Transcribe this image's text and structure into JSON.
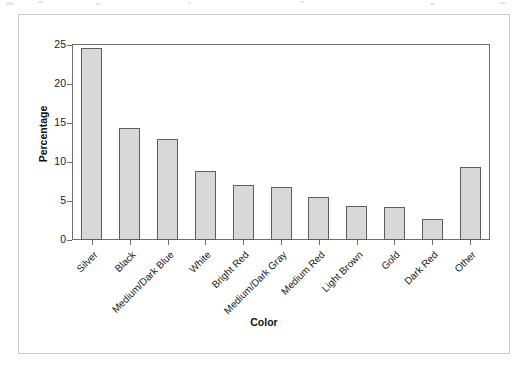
{
  "figure": {
    "background_color": "#ffffff",
    "frame_color": "#c9c9c9",
    "axis_color": "#6e6e6e"
  },
  "chart_data": {
    "type": "bar",
    "title": "",
    "subtitle": "",
    "xlabel": "Color",
    "ylabel": "Percentage",
    "categories": [
      "Silver",
      "Black",
      "Medium/Dark Blue",
      "White",
      "Bright Red",
      "Medium/Dark Gray",
      "Medium Red",
      "Light Brown",
      "Gold",
      "Dark Red",
      "Other"
    ],
    "values": [
      24.6,
      14.3,
      12.9,
      8.8,
      7.0,
      6.8,
      5.5,
      4.4,
      4.2,
      2.7,
      9.4
    ],
    "ylim": [
      0,
      25
    ],
    "yticks": [
      0,
      5,
      10,
      15,
      20,
      25
    ],
    "ytick_labels": [
      "0",
      "5",
      "10",
      "15",
      "20",
      "25"
    ],
    "grid": false,
    "legend": null,
    "bar_fill_color": "#d8d8d8",
    "bar_edge_color": "#5e5e5e",
    "xtick_label_rotation": -45
  }
}
